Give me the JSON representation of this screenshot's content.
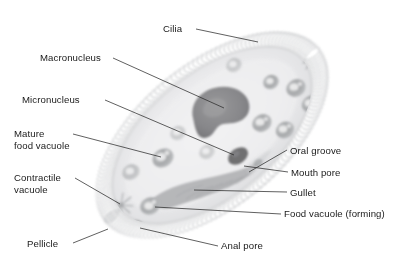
{
  "diagram": {
    "organism": "Paramecium",
    "style": "grayscale scientific illustration",
    "background_color": "#ffffff",
    "label_text_color": "#1a1a1a",
    "leader_line_color": "#2b2b2b",
    "body_fill": "#ececed",
    "body_edge": "#c3c4c6",
    "cilia_color": "#b9bbbd",
    "macronucleus_color": "#8a8a8c",
    "micronucleus_color": "#6f6f71",
    "vacuole_color": "#9c9ea0",
    "gullet_color": "#a9abad"
  },
  "labels": [
    {
      "id": "cilia",
      "text": "Cilia"
    },
    {
      "id": "macronucleus",
      "text": "Macronucleus"
    },
    {
      "id": "micronucleus",
      "text": "Micronucleus"
    },
    {
      "id": "mature-food-vacuole",
      "text": "Mature",
      "text2": "food vacuole"
    },
    {
      "id": "contractile-vacuole",
      "text": "Contractile",
      "text2": "vacuole"
    },
    {
      "id": "pellicle",
      "text": "Pellicle"
    },
    {
      "id": "oral-groove",
      "text": "Oral groove"
    },
    {
      "id": "mouth-pore",
      "text": "Mouth pore"
    },
    {
      "id": "gullet",
      "text": "Gullet"
    },
    {
      "id": "food-vacuole-forming",
      "text": "Food vacuole (forming)"
    },
    {
      "id": "anal-pore",
      "text": "Anal pore"
    }
  ],
  "structures": [
    {
      "id": "macronucleus",
      "shape": "kidney-bean",
      "note": "large dark central mass"
    },
    {
      "id": "micronucleus",
      "shape": "small-oval",
      "note": "small dark body below macronucleus"
    },
    {
      "id": "mature-food-vacuole",
      "shape": "ring",
      "note": "dark ring left of centre"
    },
    {
      "id": "contractile-vacuole",
      "shape": "radiating-star",
      "note": "two: lower-left and upper-right"
    },
    {
      "id": "gullet",
      "shape": "tapered-funnel",
      "note": "ciliated channel"
    },
    {
      "id": "oral-groove",
      "shape": "indentation",
      "note": "notch on lower-right margin"
    },
    {
      "id": "mouth-pore",
      "shape": "opening",
      "note": "at base of oral groove"
    },
    {
      "id": "food-vacuole-forming",
      "shape": "ring",
      "note": "at inner end of gullet"
    },
    {
      "id": "anal-pore",
      "shape": "small-oval",
      "note": "near lower-left margin"
    },
    {
      "id": "pellicle",
      "shape": "outer-membrane",
      "note": "cell surface layer"
    },
    {
      "id": "cilia",
      "shape": "hair-fringe",
      "note": "fringe around entire body"
    }
  ]
}
